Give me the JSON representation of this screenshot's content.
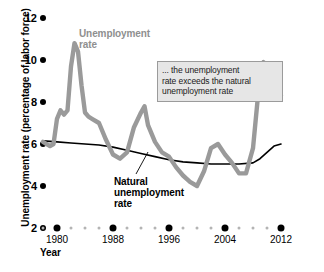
{
  "chart_data": {
    "type": "line",
    "title": "",
    "xlabel": "Year",
    "ylabel": "Unemployment rate (percentage of labor force)",
    "xlim": [
      1978,
      2013
    ],
    "ylim": [
      2,
      12
    ],
    "grid": false,
    "legend_position": "inline-labels",
    "y_ticks": [
      2,
      4,
      6,
      8,
      10,
      12
    ],
    "x_ticks_major": [
      1980,
      1988,
      1996,
      2004,
      2012
    ],
    "x_tick_step_minor": 2,
    "x_minor_years": [
      1978,
      1982,
      1984,
      1986,
      1990,
      1992,
      1994,
      1998,
      2000,
      2002,
      2006,
      2008,
      2010
    ],
    "annotations": [
      {
        "name": "callout",
        "text": "... the unemployment\nrate exceeds the natural\nunemployment rate"
      }
    ],
    "series": [
      {
        "name": "Unemployment rate",
        "color": "#9a9a9a",
        "label_text": "Unemployment\nrate",
        "x": [
          1978,
          1979,
          1979.5,
          1980,
          1980.5,
          1981,
          1981.5,
          1982,
          1982.5,
          1983,
          1983.5,
          1984,
          1984.5,
          1985,
          1986,
          1987,
          1988,
          1989,
          1990,
          1991,
          1992,
          1992.5,
          1993,
          1994,
          1995,
          1996,
          1997,
          1998,
          1999,
          2000,
          2001,
          2002,
          2003,
          2004,
          2005,
          2006,
          2007,
          2008,
          2009,
          2009.5,
          2010,
          2010.5,
          2011,
          2011.5,
          2012
        ],
        "y": [
          6.1,
          5.9,
          6.0,
          7.2,
          7.6,
          7.4,
          7.6,
          9.7,
          10.8,
          10.4,
          8.8,
          7.5,
          7.3,
          7.2,
          7.0,
          6.2,
          5.5,
          5.3,
          5.6,
          6.8,
          7.5,
          7.8,
          6.9,
          6.1,
          5.6,
          5.4,
          4.9,
          4.5,
          4.2,
          4.0,
          4.7,
          5.8,
          6.0,
          5.5,
          5.1,
          4.6,
          4.6,
          5.8,
          9.3,
          9.9,
          9.6,
          9.8,
          9.1,
          9.0,
          8.3
        ]
      },
      {
        "name": "Natural unemployment rate",
        "color": "#000000",
        "label_text": "Natural\nunemployment\nrate",
        "x": [
          1978,
          1980,
          1982,
          1984,
          1986,
          1988,
          1990,
          1992,
          1994,
          1996,
          1998,
          2000,
          2002,
          2004,
          2006,
          2008,
          2009,
          2010,
          2011,
          2012
        ],
        "y": [
          6.15,
          6.1,
          6.05,
          6.0,
          5.95,
          5.85,
          5.7,
          5.55,
          5.4,
          5.25,
          5.15,
          5.1,
          5.05,
          5.05,
          5.05,
          5.1,
          5.3,
          5.6,
          5.9,
          6.0
        ]
      }
    ]
  },
  "axis": {
    "y_title": "Unemployment rate (percentage of labor force)",
    "x_title": "Year",
    "y_labels": [
      "12",
      "10",
      "8",
      "6",
      "4",
      "2"
    ],
    "x_labels": [
      "1980",
      "1988",
      "1996",
      "2004",
      "2012"
    ]
  },
  "labels": {
    "unemployment_rate": "Unemployment\nrate",
    "natural_rate": "Natural\nunemployment\nrate",
    "callout": "... the unemployment\nrate exceeds the natural\nunemployment rate"
  },
  "colors": {
    "unemployment_line": "#9a9a9a",
    "natural_line": "#000000",
    "callout_bg": "#e6e6e6",
    "callout_border": "#9b9b9b",
    "tick_major": "#000000",
    "tick_minor": "#b4b4b4"
  }
}
